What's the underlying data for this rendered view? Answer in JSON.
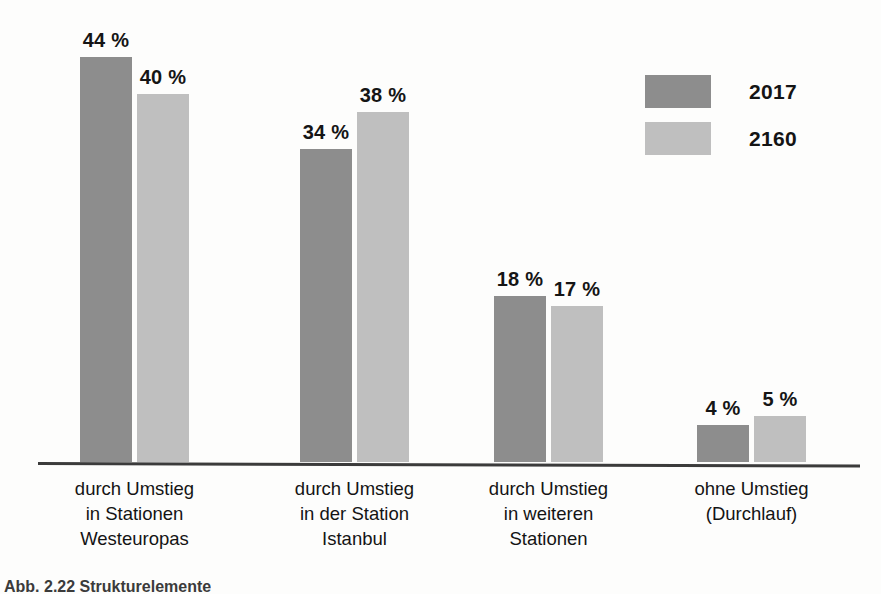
{
  "chart_data": {
    "type": "bar",
    "title": "",
    "subtitle": "",
    "xlabel": "",
    "ylabel": "",
    "ylim": [
      0,
      48
    ],
    "grid": false,
    "legend_position": "top-right",
    "value_suffix": "%",
    "categories": [
      "durch Umstieg\nin Stationen\nWesteuropas",
      "durch Umstieg\nin der Station\nIstanbul",
      "durch Umstieg\nin weiteren\nStationen",
      "ohne Umstieg\n(Durchlauf)"
    ],
    "category_lines": [
      [
        "durch Umstieg",
        "in Stationen",
        "Westeuropas"
      ],
      [
        "durch Umstieg",
        "in der Station",
        "Istanbul"
      ],
      [
        "durch Umstieg",
        "in weiteren",
        "Stationen"
      ],
      [
        "ohne Umstieg",
        "(Durchlauf)"
      ]
    ],
    "series": [
      {
        "name": "2017",
        "color": "#8d8d8d",
        "values": [
          44,
          34,
          18,
          4
        ],
        "labels": [
          "44 %",
          "34 %",
          "18 %",
          "4 %"
        ]
      },
      {
        "name": "2160",
        "color": "#bfbfbf",
        "values": [
          40,
          38,
          17,
          5
        ],
        "labels": [
          "40 %",
          "38 %",
          "17 %",
          "5 %"
        ]
      }
    ]
  },
  "legend": {
    "items": [
      {
        "label": "2017",
        "color": "#8d8d8d"
      },
      {
        "label": "2160",
        "color": "#bfbfbf"
      }
    ]
  },
  "caption": {
    "text": "Abb. 2.22  Strukturelemente"
  },
  "colors": {
    "series_2017": "#8d8d8d",
    "series_2160": "#bfbfbf",
    "axis": "#3b3b3b",
    "text": "#141414",
    "background": "#fdfdfc"
  }
}
